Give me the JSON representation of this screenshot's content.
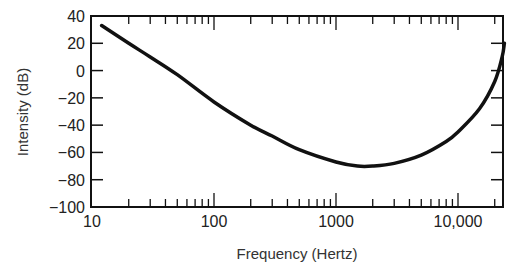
{
  "chart_data": {
    "type": "line",
    "title": "",
    "xlabel": "Frequency (Hertz)",
    "ylabel": "Intensity (dB)",
    "xscale": "log",
    "xlim": [
      10,
      27000
    ],
    "ylim": [
      -100,
      40
    ],
    "x_ticks": [
      10,
      100,
      1000,
      10000
    ],
    "x_tick_labels": [
      "10",
      "100",
      "1000",
      "10,000"
    ],
    "y_ticks": [
      40,
      20,
      0,
      -20,
      -40,
      -60,
      -80,
      -100
    ],
    "y_tick_labels": [
      "40",
      "20",
      "0",
      "−20",
      "−40",
      "−60",
      "−80",
      "−100"
    ],
    "grid": false,
    "legend": null,
    "series": [
      {
        "name": "Threshold curve",
        "x": [
          12,
          20,
          30,
          50,
          100,
          200,
          300,
          500,
          1000,
          1500,
          2000,
          3000,
          5000,
          8000,
          10000,
          15000,
          20000,
          23000,
          24000
        ],
        "y": [
          33,
          20,
          10,
          -3,
          -23,
          -40,
          -48,
          -58,
          -67,
          -70,
          -70,
          -68,
          -62,
          -52,
          -45,
          -28,
          -8,
          10,
          20
        ]
      }
    ]
  }
}
